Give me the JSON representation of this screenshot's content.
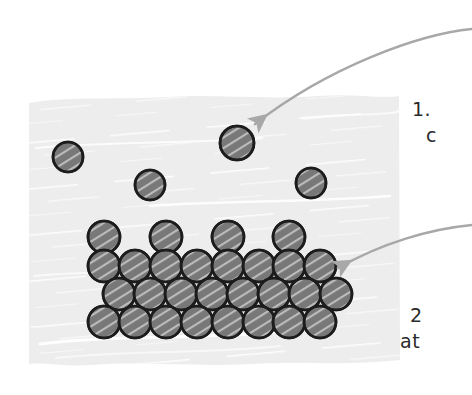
{
  "figure": {
    "style": "hand-drawn sketch",
    "canvas": {
      "width": 472,
      "height": 395,
      "background": "#ffffff"
    }
  },
  "slab": {
    "name": "vapor-region-slab",
    "fill": "#ededed",
    "x": 28,
    "y": 95,
    "width": 372,
    "height": 270,
    "texture": "diagonal white marker streaks, wavy hand-drawn edges"
  },
  "atom_style": {
    "fill": "#787878",
    "stroke": "#1c1c1c",
    "stroke_width": 2.6,
    "highlight": "#e8e8e8",
    "radius": 15.5
  },
  "free_atoms": {
    "label": "free atoms in vapor",
    "count": 4,
    "positions": [
      {
        "cx": 68,
        "cy": 157,
        "r": 15
      },
      {
        "cx": 150,
        "cy": 185,
        "r": 15
      },
      {
        "cx": 237,
        "cy": 143,
        "r": 17
      },
      {
        "cx": 311,
        "cy": 183,
        "r": 15
      }
    ]
  },
  "lattice": {
    "label": "crystal lattice",
    "rows": [
      {
        "name": "adatom-row",
        "cy": 237,
        "r": 16,
        "xs": [
          104,
          166,
          228,
          289
        ]
      },
      {
        "name": "surface-row",
        "cy": 266,
        "r": 16,
        "xs": [
          104,
          135,
          166,
          197,
          228,
          259,
          289,
          320
        ]
      },
      {
        "name": "bulk-row-1",
        "cy": 294,
        "r": 16,
        "xs": [
          119,
          150,
          181,
          212,
          243,
          274,
          305,
          336
        ]
      },
      {
        "name": "bulk-row-2",
        "cy": 322,
        "r": 16,
        "xs": [
          104,
          135,
          166,
          197,
          228,
          259,
          289,
          320
        ]
      }
    ]
  },
  "arrows": {
    "color": "#a8a8a8",
    "width": 2.6,
    "items": [
      {
        "name": "arrow-to-free-atom",
        "from_x": 472,
        "from_y": 30,
        "to_x": 253,
        "to_y": 126,
        "path": "M 472 29 C 420 34 330 66 255 124",
        "head_at": {
          "x": 255,
          "y": 124
        }
      },
      {
        "name": "arrow-to-lattice",
        "from_x": 472,
        "from_y": 226,
        "to_x": 336,
        "to_y": 269,
        "path": "M 472 225 C 430 229 382 243 338 268",
        "head_at": {
          "x": 338,
          "y": 268
        }
      }
    ]
  },
  "labels": {
    "label_1": {
      "name": "callout-label-1",
      "line1": "1.",
      "line2": "c",
      "note": "text is cropped by the right image edge"
    },
    "label_2": {
      "name": "callout-label-2",
      "line1": "2",
      "line2": "at",
      "note": "text is cropped by the right image edge"
    }
  }
}
